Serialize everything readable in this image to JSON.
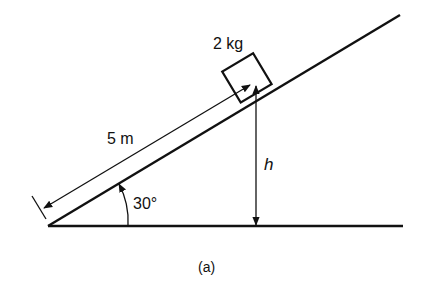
{
  "figure": {
    "caption": "(a)",
    "labels": {
      "mass": "2 kg",
      "length": "5 m",
      "angle": "30°",
      "height": "h"
    },
    "colors": {
      "ink": "#111111",
      "background": "#ffffff"
    }
  }
}
